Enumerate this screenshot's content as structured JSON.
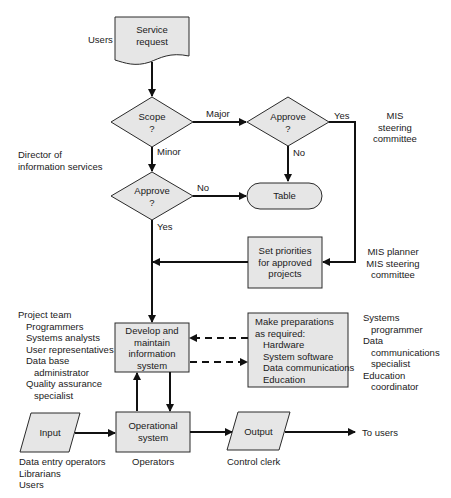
{
  "nodes": {
    "service_request": {
      "line1": "Service",
      "line2": "request"
    },
    "scope": {
      "line1": "Scope",
      "line2": "?"
    },
    "approve_major": {
      "line1": "Approve",
      "line2": "?"
    },
    "approve_minor": {
      "line1": "Approve",
      "line2": "?"
    },
    "table": {
      "label": "Table"
    },
    "set_priorities": {
      "line1": "Set priorities",
      "line2": "for approved",
      "line3": "projects"
    },
    "develop": {
      "line1": "Develop and",
      "line2": "maintain",
      "line3": "information",
      "line4": "system"
    },
    "preparations": {
      "title1": "Make preparations",
      "title2": "as required:",
      "items": [
        "Hardware",
        "System software",
        "Data communications",
        "Education"
      ]
    },
    "input": {
      "label": "Input"
    },
    "operational": {
      "line1": "Operational",
      "line2": "system"
    },
    "output": {
      "label": "Output"
    }
  },
  "edge_labels": {
    "major": "Major",
    "minor": "Minor",
    "yes_major": "Yes",
    "no_major": "No",
    "no_minor": "No",
    "yes_minor": "Yes",
    "to_users": "To users"
  },
  "roles": {
    "users_top": "Users",
    "director": {
      "line1": "Director of",
      "line2": "information services"
    },
    "mis_committee": {
      "line1": "MIS",
      "line2": "steering",
      "line3": "committee"
    },
    "mis_planner": {
      "line1": "MIS planner",
      "line2": "MIS steering",
      "line3": "committee"
    },
    "project_team": {
      "title": "Project team",
      "members": [
        "Programmers",
        "Systems analysts",
        "User representatives",
        "Data base",
        "administrator",
        "Quality assurance",
        "specialist"
      ]
    },
    "support_staff": [
      "Systems",
      "programmer",
      "Data",
      "communications",
      "specialist",
      "Education",
      "coordinator"
    ],
    "input_roles": [
      "Data entry operators",
      "Librarians",
      "Users"
    ],
    "operators": "Operators",
    "control_clerk": "Control clerk"
  },
  "colors": {
    "fill": "#e6e6e6",
    "stroke": "#2a2a2a",
    "line": "#111111"
  }
}
